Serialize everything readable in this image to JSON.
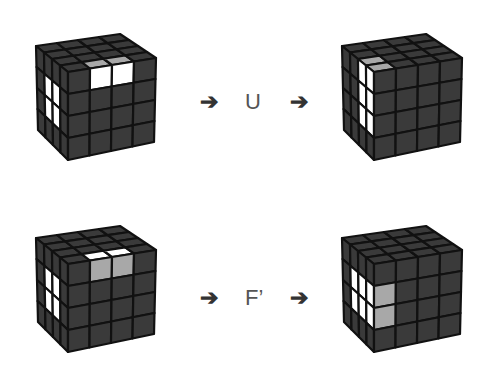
{
  "rows": [
    {
      "move": "U",
      "before": {
        "label": "before U",
        "top_highlight": [
          [
            3,
            1
          ],
          [
            3,
            2
          ]
        ],
        "front_white": [
          [
            0,
            1
          ],
          [
            0,
            2
          ]
        ],
        "left_white": [
          [
            0,
            0
          ],
          [
            0,
            1
          ],
          [
            1,
            0
          ],
          [
            1,
            1
          ]
        ]
      },
      "after": {
        "label": "after U"
      }
    },
    {
      "move": "F’",
      "before": {
        "label": "before F'"
      },
      "after": {
        "label": "after F'"
      }
    }
  ],
  "arrow_glyph": "➔",
  "colors": {
    "sticker_dark": "#3a3a3a",
    "sticker_white": "#ffffff",
    "sticker_gray": "#a8a8a8",
    "cube_border": "#111111"
  }
}
